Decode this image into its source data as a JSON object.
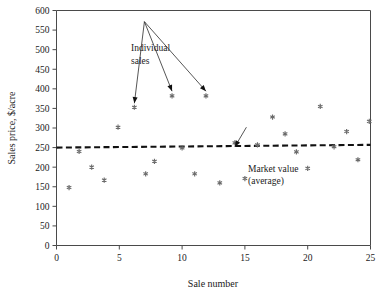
{
  "figure": {
    "top_partial_caption": "",
    "background": "#ffffff",
    "marker_color": "#6b6b6b",
    "axis_color": "#4a4a4a",
    "average_line_color": "#111111"
  },
  "chart_data": {
    "type": "scatter",
    "title": "",
    "xlabel": "Sale number",
    "ylabel": "Sales price, $/acre",
    "xlim": [
      0,
      25
    ],
    "ylim": [
      0,
      600
    ],
    "xticks": [
      0,
      5,
      10,
      15,
      20,
      25
    ],
    "yticks": [
      0,
      50,
      100,
      150,
      200,
      250,
      300,
      350,
      400,
      450,
      500,
      550,
      600
    ],
    "xtick_labels": [
      "0",
      "5",
      "10",
      "15",
      "20",
      "25"
    ],
    "ytick_labels": [
      "0",
      "50",
      "100",
      "150",
      "200",
      "250",
      "300",
      "350",
      "400",
      "450",
      "500",
      "550",
      "600"
    ],
    "grid": false,
    "legend": "none",
    "series": [
      {
        "name": "Individual sales",
        "marker": "asterisk",
        "points": [
          {
            "x": 1.0,
            "y": 148
          },
          {
            "x": 1.8,
            "y": 240
          },
          {
            "x": 2.8,
            "y": 200
          },
          {
            "x": 3.8,
            "y": 167
          },
          {
            "x": 4.9,
            "y": 302
          },
          {
            "x": 6.2,
            "y": 353
          },
          {
            "x": 7.1,
            "y": 183
          },
          {
            "x": 7.8,
            "y": 215
          },
          {
            "x": 9.2,
            "y": 382
          },
          {
            "x": 10.0,
            "y": 249
          },
          {
            "x": 11.0,
            "y": 183
          },
          {
            "x": 11.9,
            "y": 382
          },
          {
            "x": 13.0,
            "y": 160
          },
          {
            "x": 14.2,
            "y": 262
          },
          {
            "x": 15.0,
            "y": 171
          },
          {
            "x": 16.0,
            "y": 257
          },
          {
            "x": 17.2,
            "y": 328
          },
          {
            "x": 18.2,
            "y": 285
          },
          {
            "x": 19.1,
            "y": 239
          },
          {
            "x": 20.0,
            "y": 197
          },
          {
            "x": 21.0,
            "y": 355
          },
          {
            "x": 22.1,
            "y": 252
          },
          {
            "x": 23.1,
            "y": 291
          },
          {
            "x": 24.0,
            "y": 219
          },
          {
            "x": 24.9,
            "y": 317
          }
        ]
      }
    ],
    "reference_line": {
      "name": "Market value (average)",
      "style": "dashed",
      "x_start": 0,
      "y_start": 250,
      "x_end": 25,
      "y_end": 257
    },
    "annotations": [
      {
        "name": "individual-sales-annotation",
        "text_line1": "Individual",
        "text_line2": "sales",
        "text_x": 7.0,
        "text_y": 500,
        "arrow_targets": [
          {
            "x": 6.2,
            "y": 363
          },
          {
            "x": 9.2,
            "y": 394
          },
          {
            "x": 11.9,
            "y": 394
          }
        ]
      },
      {
        "name": "market-value-annotation",
        "text_line1": "Market value",
        "text_line2": "(average)",
        "text_x": 15.2,
        "text_y": 205,
        "arrow_targets": [
          {
            "x": 14.2,
            "y": 252
          }
        ]
      }
    ]
  }
}
